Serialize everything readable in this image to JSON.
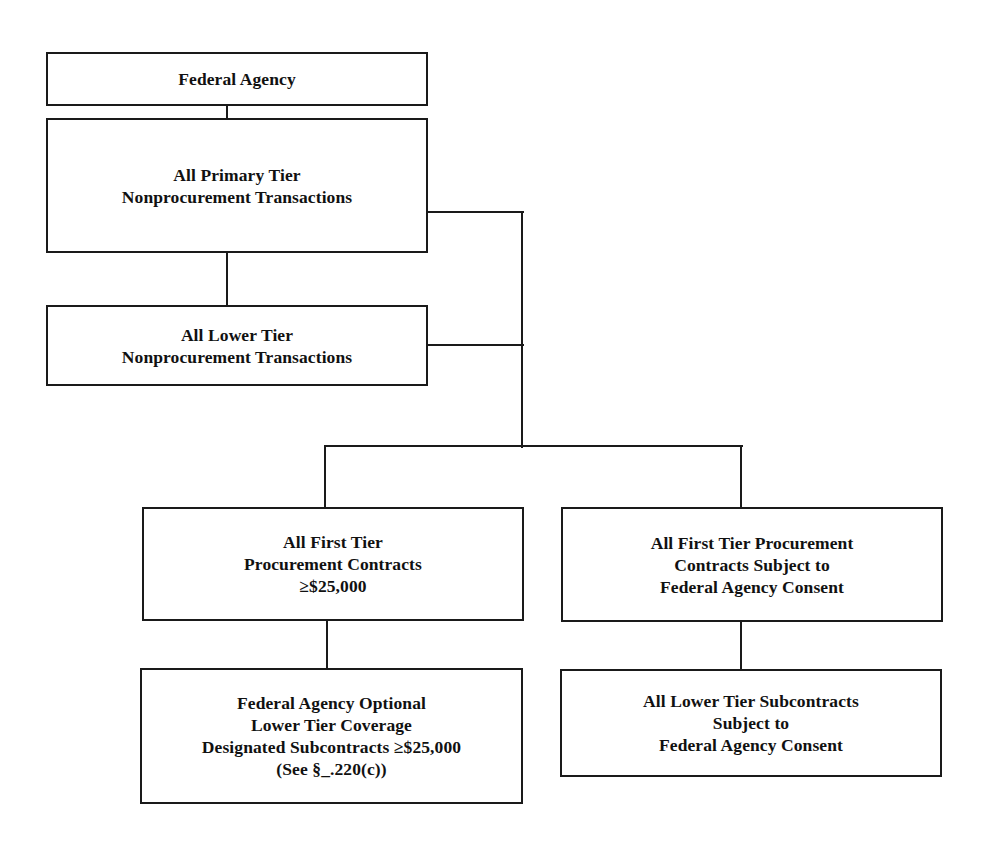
{
  "diagram": {
    "type": "hierarchy",
    "nodes": [
      {
        "id": "federal-agency",
        "lines": [
          "Federal Agency"
        ]
      },
      {
        "id": "primary-tier",
        "lines": [
          "All Primary Tier",
          "Nonprocurement Transactions"
        ]
      },
      {
        "id": "lower-tier",
        "lines": [
          "All Lower Tier",
          "Nonprocurement Transactions"
        ]
      },
      {
        "id": "first-tier-procurement",
        "lines": [
          "All First Tier",
          "Procurement Contracts",
          "≥$25,000"
        ]
      },
      {
        "id": "first-tier-consent",
        "lines": [
          "All First Tier Procurement",
          "Contracts Subject to",
          "Federal Agency Consent"
        ]
      },
      {
        "id": "optional-coverage",
        "lines": [
          "Federal Agency Optional",
          "Lower Tier Coverage",
          "Designated Subcontracts ≥$25,000",
          "(See §_.220(c))"
        ]
      },
      {
        "id": "lower-tier-subcontracts",
        "lines": [
          "All Lower Tier Subcontracts",
          "Subject to",
          "Federal Agency Consent"
        ]
      }
    ],
    "edges": [
      [
        "federal-agency",
        "primary-tier"
      ],
      [
        "primary-tier",
        "lower-tier"
      ],
      [
        "primary-tier",
        "first-tier-procurement"
      ],
      [
        "primary-tier",
        "first-tier-consent"
      ],
      [
        "lower-tier",
        "first-tier-procurement"
      ],
      [
        "lower-tier",
        "first-tier-consent"
      ],
      [
        "first-tier-procurement",
        "optional-coverage"
      ],
      [
        "first-tier-consent",
        "lower-tier-subcontracts"
      ]
    ]
  }
}
